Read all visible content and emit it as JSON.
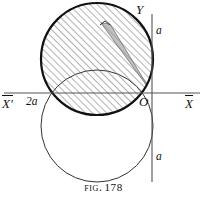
{
  "figure": {
    "caption_prefix": "Fig.",
    "caption_number": "178",
    "background_color": "#ffffff",
    "ink_color": "#111111"
  },
  "axes": {
    "origin_label": "O",
    "x_negative_label": "X'",
    "x_positive_label": "X",
    "y_positive_label": "Y",
    "origin_px": {
      "x": 152,
      "y": 93
    },
    "x_axis_y_px": 93,
    "y_axis_x_px": 152,
    "x_axis_start_px": 4,
    "x_axis_end_px": 200,
    "y_axis_start_px": 14,
    "y_axis_end_px": 182,
    "stroke_color": "#555555",
    "stroke_width": 1.1
  },
  "tick_labels": [
    {
      "name": "y-upper-a",
      "text": "a",
      "x_px": 156,
      "y_px": 25
    },
    {
      "name": "y-lower-a",
      "text": "a",
      "x_px": 156,
      "y_px": 151
    },
    {
      "name": "x-left-2a",
      "text": "2a",
      "x_px": 26,
      "y_px": 96
    }
  ],
  "curves": {
    "upper_circle": {
      "name": "upper-circle-shaded",
      "center_x_px": 97,
      "center_y_px": 59,
      "radius_px": 56,
      "stroke_color": "#111111",
      "stroke_width": 2.2,
      "fill": "hatched",
      "hatch_angle_deg": 45,
      "hatch_color": "#555555"
    },
    "lower_circle": {
      "name": "lower-circle-open",
      "center_x_px": 97,
      "center_y_px": 126,
      "radius_px": 56,
      "stroke_color": "#333333",
      "stroke_width": 1.0,
      "fill": "none"
    }
  },
  "wedge": {
    "name": "gray-sector-wedge",
    "apex_x_px": 152,
    "apex_y_px": 93,
    "tip_left_x_px": 101,
    "tip_left_y_px": 23,
    "tip_right_x_px": 110,
    "tip_right_y_px": 24,
    "fill_color": "#9a9a9a",
    "fill_opacity": 0.62,
    "stroke_color": "#666666",
    "stroke_width": 0.7
  },
  "markers": {
    "apex_tick": {
      "name": "wedge-apex-tick",
      "x_px": 105,
      "y_px": 22
    }
  }
}
